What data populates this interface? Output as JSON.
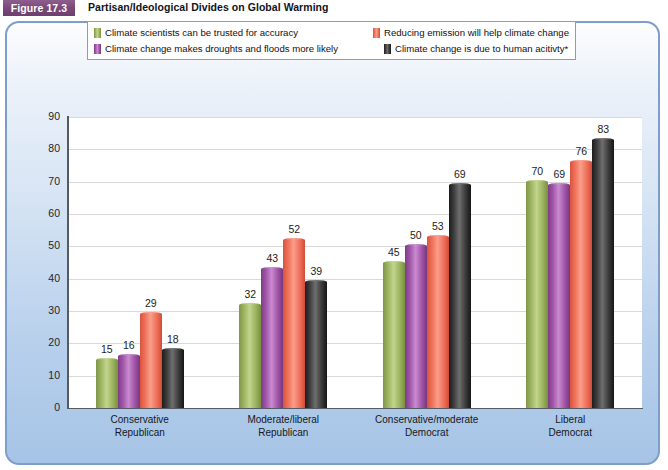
{
  "figure": {
    "badge": "Figure 17.3",
    "title": "Partisan/Ideological Divides on Global Warming"
  },
  "chart_data": {
    "type": "bar",
    "title": "Partisan/Ideological Divides on Global Warming",
    "xlabel": "",
    "ylabel": "",
    "ylim": [
      0,
      90
    ],
    "yticks": [
      "0",
      "10",
      "20",
      "30",
      "40",
      "50",
      "60",
      "70",
      "80",
      "90"
    ],
    "grid": true,
    "legend_position": "top",
    "categories": [
      "Conservative Republican",
      "Moderate/liberal Republican",
      "Conservative/moderate Democrat",
      "Liberal Democrat"
    ],
    "category_lines": [
      [
        "Conservative",
        "Republican"
      ],
      [
        "Moderate/liberal",
        "Republican"
      ],
      [
        "Conservative/moderate",
        "Democrat"
      ],
      [
        "Liberal",
        "Democrat"
      ]
    ],
    "series": [
      {
        "name": "Climate scientists can be trusted for accuracy",
        "color": "#9cb45f",
        "values": [
          15,
          32,
          45,
          70
        ]
      },
      {
        "name": "Climate change makes droughts and floods more likely",
        "color": "#a055a8",
        "values": [
          16,
          43,
          50,
          69
        ]
      },
      {
        "name": "Reducing emission will help climate change",
        "color": "#ef7059",
        "values": [
          29,
          52,
          53,
          76
        ]
      },
      {
        "name": "Climate change is due to human acitivty*",
        "color": "#3a3a3a",
        "values": [
          18,
          39,
          69,
          83
        ]
      }
    ]
  },
  "colors": {
    "badge": "#7c4a7c",
    "panel_border": "#7e9dc8",
    "panel_fill": "#b8d0ec",
    "series_green": "#9cb45f",
    "series_purple": "#a055a8",
    "series_red": "#ef7059",
    "series_gray": "#3a3a3a"
  }
}
